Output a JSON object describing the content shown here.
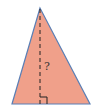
{
  "diagram": {
    "shape": "triangle",
    "fill_color": "#f0a08a",
    "stroke_color": "#5a7fb5",
    "height_label": "?",
    "height_line_style": "dashed",
    "right_angle_marker": true
  }
}
